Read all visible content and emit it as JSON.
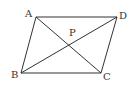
{
  "figure": {
    "type": "parallelogram-with-diagonals",
    "stroke_color": "#333333",
    "background": "#ffffff",
    "points": {
      "A": {
        "label": "A",
        "x": 36,
        "y": 17
      },
      "D": {
        "label": "D",
        "x": 117,
        "y": 17
      },
      "B": {
        "label": "B",
        "x": 21,
        "y": 73
      },
      "C": {
        "label": "C",
        "x": 101,
        "y": 73
      },
      "P": {
        "label": "P",
        "x": 72,
        "y": 40
      }
    },
    "segments": [
      "AD",
      "DC",
      "CB",
      "BA",
      "AC",
      "BD"
    ]
  }
}
